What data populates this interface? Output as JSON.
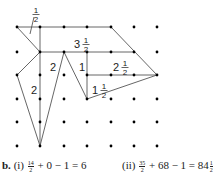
{
  "diagram": {
    "grid": {
      "x": [
        17,
        40,
        64,
        87,
        111,
        134,
        157
      ],
      "y": [
        27,
        52,
        75,
        99,
        122,
        146
      ],
      "dot_color": "#000000"
    },
    "line_color": "#555555",
    "region_labels": [
      {
        "id": "half-top",
        "whole": "",
        "num": "1",
        "den": "2",
        "x": 33,
        "y": 14
      },
      {
        "id": "three-half",
        "whole": "3",
        "num": "1",
        "den": "2",
        "x": 74,
        "y": 44
      },
      {
        "id": "two-left-upper",
        "whole": "2",
        "num": "",
        "den": "",
        "x": 50,
        "y": 67
      },
      {
        "id": "one",
        "whole": "1",
        "num": "",
        "den": "",
        "x": 79,
        "y": 67
      },
      {
        "id": "two-half",
        "whole": "2",
        "num": "1",
        "den": "2",
        "x": 113,
        "y": 67
      },
      {
        "id": "two-left-lower",
        "whole": "2",
        "num": "",
        "den": "",
        "x": 31,
        "y": 90
      },
      {
        "id": "one-half",
        "whole": "1",
        "num": "1",
        "den": "2",
        "x": 92,
        "y": 90
      }
    ]
  },
  "caption": {
    "label": "b.",
    "part1": {
      "roman": "(i)",
      "frac_num": "14",
      "frac_den": "2",
      "rest": "+ 0 − 1 = 6"
    },
    "part2": {
      "roman": "(ii)",
      "frac_num": "35",
      "frac_den": "2",
      "rest": "+ 68 − 1 = 84",
      "mixed_num": "1",
      "mixed_den": "2"
    }
  }
}
